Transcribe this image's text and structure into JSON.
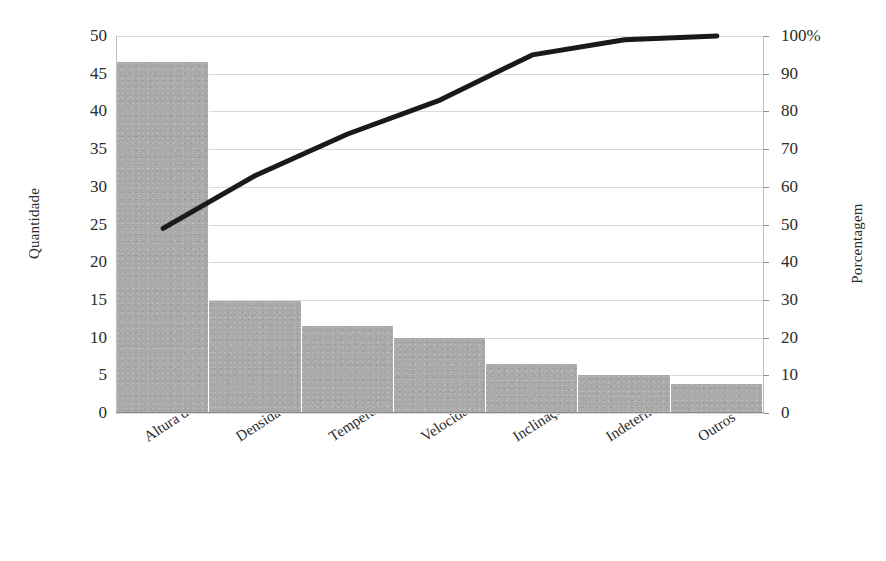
{
  "chart_data": {
    "type": "bar",
    "title": "",
    "subtitle": "",
    "xlabel": "",
    "ylabel": "Quantidade",
    "y2label": "Porcentagem",
    "grid": true,
    "legend": "none",
    "categories": [
      "Altura da onde de…",
      "Densidade relativa…",
      "Temperatura da…",
      "Velocidade do…",
      "Inclinação do…",
      "Indeterminado",
      "Outros"
    ],
    "series": [
      {
        "name": "Quantidade",
        "type": "bar",
        "values": [
          46.5,
          14.8,
          11.6,
          10.0,
          6.5,
          5.0,
          3.8
        ]
      },
      {
        "name": "Porcentagem acumulada",
        "type": "line",
        "values": [
          49,
          63,
          74,
          83,
          95,
          99,
          100
        ]
      }
    ],
    "ylim": [
      0,
      50
    ],
    "yticks": [
      0,
      5,
      10,
      15,
      20,
      25,
      30,
      35,
      40,
      45,
      50
    ],
    "ytick_labels": [
      "0",
      "5",
      "10",
      "15",
      "20",
      "25",
      "30",
      "35",
      "40",
      "45",
      "50"
    ],
    "y2lim": [
      0,
      100
    ],
    "y2ticks": [
      0,
      10,
      20,
      30,
      40,
      50,
      60,
      70,
      80,
      90,
      100
    ],
    "y2tick_labels": [
      "0",
      "10",
      "20",
      "30",
      "40",
      "50",
      "60",
      "70",
      "80",
      "90",
      "100%"
    ],
    "colors": {
      "bar": "#a9a9a9",
      "line": "#1a1a1a",
      "grid": "#d9d9d9",
      "axis": "#8c8c8c",
      "text": "#2b2b2b"
    }
  }
}
